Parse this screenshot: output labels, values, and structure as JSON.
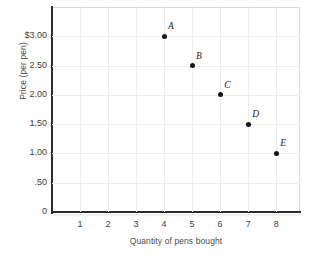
{
  "chart_data": {
    "type": "scatter",
    "title": "",
    "xlabel": "Quantity of pens bought",
    "ylabel": "Price (per pen)",
    "xlim": [
      0,
      8.85
    ],
    "ylim": [
      0,
      3.5
    ],
    "grid": true,
    "legend": "none",
    "x_ticks": [
      "1",
      "2",
      "3",
      "4",
      "5",
      "6",
      "7",
      "8"
    ],
    "x_tick_values": [
      1,
      2,
      3,
      4,
      5,
      6,
      7,
      8
    ],
    "y_ticks": [
      "0",
      ".50",
      "1.00",
      "1.50",
      "2.00",
      "2.50",
      "$3.00"
    ],
    "y_tick_values": [
      0,
      0.5,
      1.0,
      1.5,
      2.0,
      2.5,
      3.0
    ],
    "point_labels": [
      "A",
      "B",
      "C",
      "D",
      "E"
    ],
    "x": [
      4,
      5,
      6,
      7,
      8
    ],
    "y": [
      3.0,
      2.5,
      2.0,
      1.5,
      1.0
    ],
    "points": [
      {
        "label": "A",
        "x": 4,
        "y": 3.0
      },
      {
        "label": "B",
        "x": 5,
        "y": 2.5
      },
      {
        "label": "C",
        "x": 6,
        "y": 2.0
      },
      {
        "label": "D",
        "x": 7,
        "y": 1.5
      },
      {
        "label": "E",
        "x": 8,
        "y": 1.0
      }
    ],
    "colors": {
      "marker": "#141414",
      "axis": "#2b2b2b",
      "grid": "#ededed",
      "background": "#ffffff",
      "text": "#3d3d3d"
    }
  }
}
